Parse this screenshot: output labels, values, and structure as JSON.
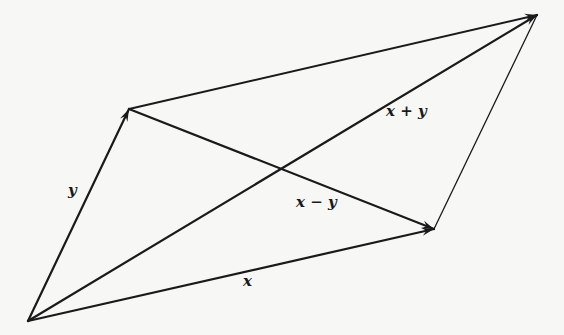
{
  "diagram": {
    "type": "vector-parallelogram",
    "colors": {
      "stroke": "#1a1a1a",
      "background": "#f7f7f5"
    },
    "points": {
      "origin": [
        28,
        321
      ],
      "y_tip": [
        129,
        109
      ],
      "sum_tip": [
        537,
        15
      ],
      "x_tip": [
        434,
        229
      ]
    },
    "vectors": [
      {
        "name": "y",
        "from": "origin",
        "to": "y_tip",
        "arrow": true,
        "width": 2.2
      },
      {
        "name": "x",
        "from": "origin",
        "to": "x_tip",
        "arrow": true,
        "width": 2.2
      },
      {
        "name": "x+y",
        "from": "origin",
        "to": "sum_tip",
        "arrow": true,
        "width": 2.2
      },
      {
        "name": "x-y",
        "from": "y_tip",
        "to": "x_tip",
        "arrow": true,
        "width": 2.2
      },
      {
        "name": "top-edge",
        "from": "y_tip",
        "to": "sum_tip",
        "arrow": true,
        "width": 2.0
      },
      {
        "name": "right-edge",
        "from": "x_tip",
        "to": "sum_tip",
        "arrow": false,
        "width": 1.3
      }
    ],
    "labels": {
      "y": "y",
      "x": "x",
      "x_plus_y": "x + y",
      "x_minus_y": "x − y"
    }
  }
}
